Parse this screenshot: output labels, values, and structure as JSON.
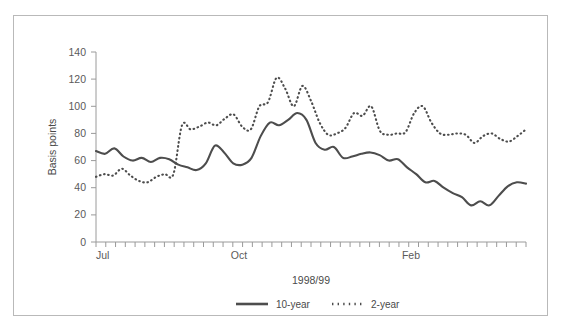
{
  "chart_data": {
    "type": "line",
    "title": "",
    "xlabel": "1998/99",
    "ylabel": "Basis points",
    "ylim": [
      0,
      140
    ],
    "yticks": [
      0,
      20,
      40,
      60,
      80,
      100,
      120,
      140
    ],
    "xtick_labels": [
      "Jul",
      "Oct",
      "Feb"
    ],
    "xtick_positions": [
      0,
      15,
      33
    ],
    "grid": false,
    "legend_position": "bottom",
    "n_points": 45,
    "series": [
      {
        "name": "10-year",
        "style": "solid",
        "color": "#4d4d4d",
        "values": [
          67,
          65,
          69,
          63,
          60,
          62,
          59,
          62,
          61,
          57,
          55,
          53,
          58,
          71,
          66,
          58,
          57,
          62,
          78,
          88,
          86,
          90,
          95,
          90,
          73,
          68,
          70,
          62,
          63,
          65,
          66,
          64,
          60,
          61,
          55,
          50,
          44,
          45,
          40,
          36,
          33,
          27,
          30,
          27,
          34,
          41,
          44,
          43
        ]
      },
      {
        "name": "2-year",
        "style": "dotted",
        "color": "#4d4d4d",
        "values": [
          48,
          50,
          49,
          54,
          49,
          45,
          44,
          48,
          50,
          50,
          86,
          83,
          85,
          88,
          86,
          91,
          94,
          85,
          83,
          100,
          103,
          121,
          113,
          100,
          115,
          104,
          88,
          79,
          80,
          84,
          95,
          93,
          100,
          82,
          79,
          80,
          81,
          95,
          100,
          88,
          80,
          79,
          80,
          79,
          73,
          78,
          80,
          76,
          74,
          78,
          83
        ]
      }
    ]
  },
  "axis": {
    "y_tick_0": "0",
    "y_tick_20": "20",
    "y_tick_40": "40",
    "y_tick_60": "60",
    "y_tick_80": "80",
    "y_tick_100": "100",
    "y_tick_120": "120",
    "y_tick_140": "140",
    "x_tick_jul": "Jul",
    "x_tick_oct": "Oct",
    "x_tick_feb": "Feb",
    "y_axis_title": "Basis points",
    "x_axis_title": "1998/99"
  },
  "legend": {
    "entry_1": "10-year",
    "entry_2": "2-year"
  }
}
